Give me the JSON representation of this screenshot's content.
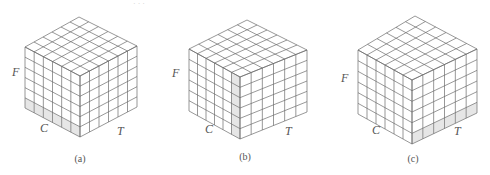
{
  "figure": {
    "header_fragment": "· · ·",
    "grid_size": 6,
    "line_color": "#6b6b6b",
    "highlight_color": "#e6e6e6",
    "panels": [
      {
        "id": "a",
        "caption": "(a)",
        "labels": {
          "F": "F",
          "C": "C",
          "T": "T"
        },
        "highlight": "bottom row of C face",
        "geom": {
          "top": [
            79,
            17
          ],
          "left": [
            25,
            47
          ],
          "front": [
            80,
            76
          ],
          "right": [
            137,
            46
          ],
          "h": 61
        },
        "label_pos": {
          "F": [
            12,
            76
          ],
          "C": [
            40,
            132
          ],
          "T": [
            117,
            135
          ],
          "caption": [
            80,
            162
          ]
        },
        "highlight_face": "left",
        "highlight_axis": "row",
        "highlight_index": 5
      },
      {
        "id": "b",
        "caption": "(b)",
        "labels": {
          "F": "F",
          "C": "C",
          "T": "T"
        },
        "highlight": "column of C face adjacent to front edge",
        "geom": {
          "top": [
            247,
            20
          ],
          "left": [
            189,
            49
          ],
          "front": [
            240,
            77
          ],
          "right": [
            307,
            50
          ],
          "h": 62
        },
        "label_pos": {
          "F": [
            172,
            77
          ],
          "C": [
            205,
            133
          ],
          "T": [
            285,
            135
          ],
          "caption": [
            245,
            160
          ]
        },
        "highlight_face": "left",
        "highlight_axis": "col",
        "highlight_index": 5
      },
      {
        "id": "c",
        "caption": "(c)",
        "labels": {
          "F": "F",
          "C": "C",
          "T": "T"
        },
        "highlight": "bottom row of T face",
        "geom": {
          "top": [
            415,
            16
          ],
          "left": [
            358,
            50
          ],
          "front": [
            412,
            80
          ],
          "right": [
            477,
            49
          ],
          "h": 64
        },
        "label_pos": {
          "F": [
            341,
            82
          ],
          "C": [
            372,
            134
          ],
          "T": [
            454,
            135
          ],
          "caption": [
            413,
            162
          ]
        },
        "highlight_face": "right",
        "highlight_axis": "row",
        "highlight_index": 5
      }
    ]
  }
}
